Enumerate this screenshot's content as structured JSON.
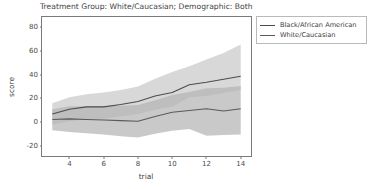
{
  "chart_data": {
    "type": "line",
    "title": "Treatment Group: White/Caucasian; Demographic: Both",
    "xlabel": "trial",
    "ylabel": "score",
    "grid": false,
    "legend_position": "upper right outside",
    "xlim": [
      2.4,
      14.6
    ],
    "ylim": [
      -28,
      88
    ],
    "xticks": [
      4,
      6,
      8,
      10,
      12,
      14
    ],
    "yticks": [
      -20,
      0,
      20,
      40,
      60,
      80
    ],
    "x": [
      3,
      4,
      5,
      6,
      7,
      8,
      9,
      10,
      11,
      12,
      13,
      14
    ],
    "series": [
      {
        "name": "Black/African American",
        "color": "#4c4c4c",
        "values": [
          7,
          11,
          13,
          13,
          15,
          17.5,
          22,
          25,
          31.5,
          33.5,
          36,
          38.5
        ],
        "ci_lower": [
          -2,
          1,
          2.5,
          3,
          5,
          7,
          10.5,
          13,
          21,
          22,
          24.5,
          27
        ],
        "ci_upper": [
          16,
          21,
          23.5,
          25,
          27,
          30,
          36.5,
          42,
          47,
          52.5,
          58,
          65
        ]
      },
      {
        "name": "White/Caucasian",
        "color": "#5a5a5a",
        "values": [
          2.5,
          3,
          2.5,
          2,
          1.5,
          1,
          5,
          8.5,
          10,
          11.5,
          9.5,
          11.5
        ],
        "ci_lower": [
          -6.5,
          -8,
          -9,
          -10,
          -11.5,
          -12.5,
          -9.5,
          -7,
          -5.5,
          -11,
          -10.5,
          -10
        ],
        "ci_upper": [
          11,
          13.5,
          13.5,
          13.5,
          14,
          14.5,
          18.5,
          23,
          25.5,
          28.5,
          29,
          30.5
        ]
      }
    ]
  },
  "legend": {
    "entries": [
      {
        "label": "Black/African American"
      },
      {
        "label": "White/Caucasian"
      }
    ]
  }
}
